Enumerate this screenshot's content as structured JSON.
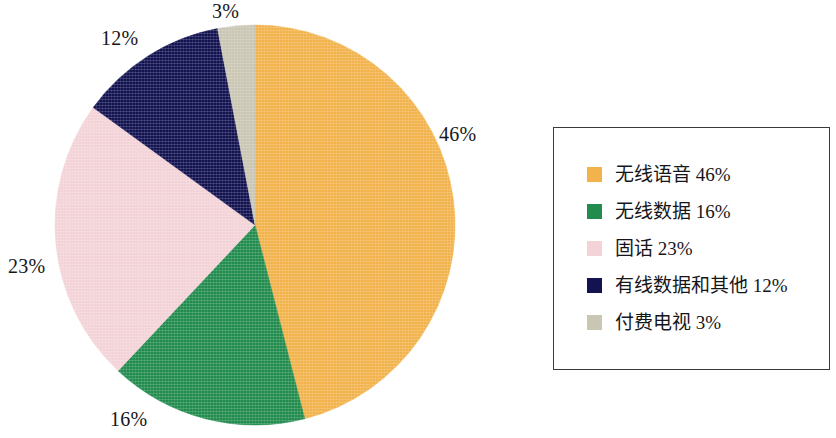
{
  "chart_data": {
    "type": "pie",
    "title": "",
    "subtitle": "",
    "xlabel": "",
    "ylabel": "",
    "grid": false,
    "legend_position": "right",
    "start_angle_deg": 0,
    "direction": "clockwise",
    "categories": [
      "无线语音",
      "无线数据",
      "固话",
      "有线数据和其他",
      "付费电视"
    ],
    "values": [
      46,
      16,
      23,
      12,
      3
    ],
    "value_suffix": "%",
    "colors": [
      "#F2B24C",
      "#228B4E",
      "#F3D3D7",
      "#131351",
      "#CAC6B4"
    ],
    "slices": [
      {
        "label": "无线语音",
        "value": 46,
        "display": "46%",
        "color": "#F2B24C",
        "legend_text": "无线语音 46%"
      },
      {
        "label": "无线数据",
        "value": 16,
        "display": "16%",
        "color": "#228B4E",
        "legend_text": "无线数据 16%"
      },
      {
        "label": "固话",
        "value": 23,
        "display": "23%",
        "color": "#F3D3D7",
        "legend_text": "固话 23%"
      },
      {
        "label": "有线数据和其他",
        "value": 12,
        "display": "12%",
        "color": "#131351",
        "legend_text": "有线数据和其他 12%"
      },
      {
        "label": "付费电视",
        "value": 3,
        "display": "3%",
        "color": "#CAC6B4",
        "legend_text": "付费电视 3%"
      }
    ],
    "callout_labels": [
      {
        "text": "46%",
        "for": "无线语音"
      },
      {
        "text": "16%",
        "for": "无线数据"
      },
      {
        "text": "23%",
        "for": "固话"
      },
      {
        "text": "12%",
        "for": "有线数据和其他"
      },
      {
        "text": "3%",
        "for": "付费电视"
      }
    ]
  },
  "legend": {
    "items": [
      {
        "label": "无线语音 46%"
      },
      {
        "label": "无线数据 16%"
      },
      {
        "label": "固话 23%"
      },
      {
        "label": "有线数据和其他 12%"
      },
      {
        "label": "付费电视 3%"
      }
    ]
  }
}
